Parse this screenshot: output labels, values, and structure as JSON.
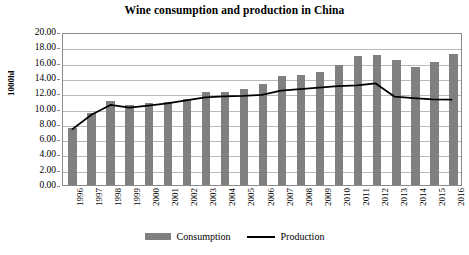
{
  "chart_data": {
    "type": "bar",
    "title": "Wine consumption and production in China",
    "xlabel": "",
    "ylabel": "1000hl",
    "ylim": [
      0,
      20
    ],
    "ytick_step": 2,
    "ytick_labels": [
      "0.00",
      "2.00",
      "4.00",
      "6.00",
      "8.00",
      "10.00",
      "12.00",
      "14.00",
      "16.00",
      "18.00",
      "20.00"
    ],
    "grid": true,
    "legend_position": "bottom",
    "categories": [
      "1996",
      "1997",
      "1998",
      "1999",
      "2000",
      "2001",
      "2002",
      "2003",
      "2004",
      "2005",
      "2006",
      "2007",
      "2008",
      "2009",
      "2010",
      "2011",
      "2012",
      "2013",
      "2014",
      "2015",
      "2016"
    ],
    "series": [
      {
        "name": "Consumption",
        "type": "bar",
        "color": "#808080",
        "values": [
          7.4,
          9.4,
          11.0,
          10.5,
          10.7,
          10.9,
          11.3,
          12.1,
          12.2,
          12.5,
          13.2,
          14.2,
          14.4,
          14.8,
          15.7,
          16.9,
          17.0,
          16.4,
          15.4,
          16.1,
          17.1
        ]
      },
      {
        "name": "Production",
        "type": "line",
        "color": "#000000",
        "values": [
          7.4,
          9.3,
          10.6,
          10.25,
          10.5,
          10.8,
          11.2,
          11.6,
          11.75,
          11.8,
          11.95,
          12.5,
          12.7,
          12.9,
          13.1,
          13.2,
          13.45,
          11.7,
          11.5,
          11.35,
          11.3
        ]
      }
    ]
  },
  "legend": {
    "items": [
      {
        "label": "Consumption",
        "marker": "bar-swatch-icon"
      },
      {
        "label": "Production",
        "marker": "line-swatch-icon"
      }
    ]
  }
}
